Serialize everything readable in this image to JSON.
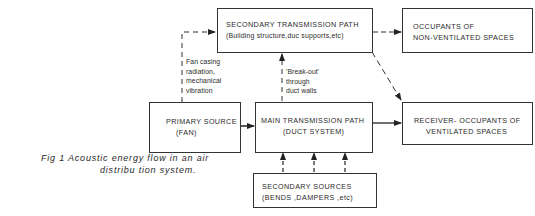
{
  "diagram": {
    "type": "flow",
    "nodes": {
      "secondary_transmission": {
        "line1": "SECONDARY TRANSMISSION PATH",
        "line2": "(Building structure,duc  supports,etc)"
      },
      "occupants_non_ventilated": {
        "line1": "OCCUPANTS OF",
        "line2": "NON-VENTILATED SPACES"
      },
      "primary_source": {
        "line1": "PRIMARY SOURCE",
        "line2": "(FAN)"
      },
      "main_transmission": {
        "line1": "MAIN TRANSMISSION PATH",
        "line2": "(DUCT SYSTEM)"
      },
      "receiver": {
        "line1": "RECEIVER- OCCUPANTS OF",
        "line2": "VENTILATED SPACES"
      },
      "secondary_sources": {
        "line1": "SECONDARY SOURCES",
        "line2": "(BENDS ,DAMPERS ,etc)"
      }
    },
    "edge_labels": {
      "fan_casing": [
        "Fan casing",
        "radiation,",
        "mechanical",
        "vibration"
      ],
      "break_out": [
        "'Break-out'",
        "through",
        "duct walls"
      ]
    },
    "edges": [
      {
        "from": "primary_source",
        "to": "main_transmission",
        "style": "solid"
      },
      {
        "from": "main_transmission",
        "to": "receiver",
        "style": "solid"
      },
      {
        "from": "primary_source",
        "to": "secondary_transmission",
        "style": "dashed",
        "label": "fan_casing"
      },
      {
        "from": "main_transmission",
        "to": "secondary_transmission",
        "style": "dashed",
        "label": "break_out"
      },
      {
        "from": "secondary_transmission",
        "to": "occupants_non_ventilated",
        "style": "dashed"
      },
      {
        "from": "secondary_transmission",
        "to": "receiver",
        "style": "dashed"
      },
      {
        "from": "secondary_sources",
        "to": "main_transmission",
        "style": "dashed",
        "count": 3
      }
    ]
  },
  "caption": {
    "line1": "Fig 1  Acoustic  energy  flow  in  an  air",
    "line2": "distribu tion system."
  }
}
